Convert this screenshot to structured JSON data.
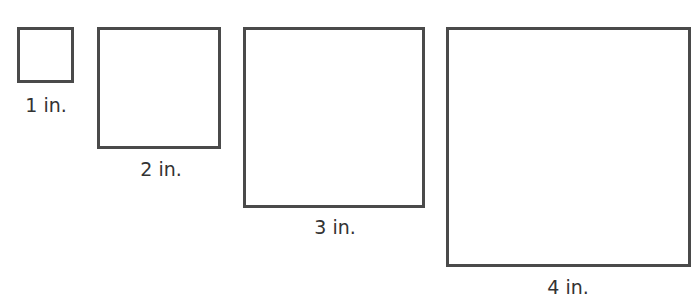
{
  "diagram": {
    "border_color": "#4a4a4a",
    "squares": [
      {
        "side": "1 in.",
        "label": "1 in."
      },
      {
        "side": "2 in.",
        "label": "2 in."
      },
      {
        "side": "3 in.",
        "label": "3 in."
      },
      {
        "side": "4 in.",
        "label": "4 in."
      }
    ]
  }
}
